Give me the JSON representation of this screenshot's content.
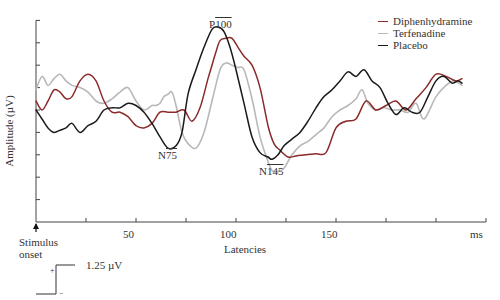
{
  "chart_data": {
    "type": "line",
    "title": "",
    "xlabel": "Latencies",
    "x_unit_label": "ms",
    "ylabel": "Amplitude (µV)",
    "xlim": [
      0,
      225
    ],
    "x_ticks": [
      0,
      25,
      50,
      75,
      100,
      125,
      150,
      175,
      200,
      225
    ],
    "x_tick_labels": {
      "50": "50",
      "100": "100",
      "150": "150",
      "225": "ms"
    },
    "y_ticks_count": 9,
    "ylim": [
      0,
      9
    ],
    "y_unit_note": "each y tick ~ 1 division; scale bar = 1.25 µV",
    "grid": false,
    "legend_position": "top-right",
    "stimulus_marker": {
      "x": 0,
      "label_line1": "Stimulus",
      "label_line2": "onset"
    },
    "annotations": [
      {
        "text": "P100",
        "x": 95,
        "y": 8.9
      },
      {
        "text": "N75",
        "x": 63,
        "y": 2.9
      },
      {
        "text": "N145",
        "x": 117,
        "y": 2.1
      }
    ],
    "scale_bar": {
      "label": "1.25 µV",
      "plus": "+",
      "minus": "−"
    },
    "series": [
      {
        "name": "Diphenhydramine",
        "color": "#8b2a2a",
        "x": [
          0,
          3,
          6,
          9,
          12,
          15,
          18,
          22,
          26,
          30,
          34,
          38,
          42,
          46,
          50,
          54,
          58,
          62,
          66,
          70,
          74,
          78,
          82,
          86,
          88,
          90,
          92,
          95,
          98,
          101,
          104,
          108,
          112,
          116,
          119,
          122,
          126,
          130,
          135,
          140,
          145,
          150,
          155,
          160,
          165,
          170,
          175,
          180,
          185,
          190,
          195,
          200,
          205,
          210,
          213
        ],
        "y": [
          5.4,
          5.0,
          5.4,
          5.9,
          5.8,
          5.5,
          5.6,
          6.3,
          6.6,
          6.3,
          5.4,
          4.9,
          4.9,
          4.7,
          4.3,
          4.2,
          4.4,
          4.9,
          4.9,
          4.9,
          5.0,
          4.5,
          5.1,
          6.4,
          7.0,
          7.6,
          8.1,
          8.2,
          8.2,
          7.8,
          7.4,
          7.0,
          6.0,
          4.3,
          3.5,
          3.2,
          2.9,
          2.95,
          3.0,
          3.05,
          3.1,
          4.2,
          4.5,
          4.6,
          5.4,
          5.0,
          5.2,
          5.4,
          5.0,
          5.5,
          6.0,
          6.6,
          6.5,
          6.3,
          6.4
        ]
      },
      {
        "name": "Terfenadine",
        "color": "#b8b8b8",
        "x": [
          0,
          3,
          6,
          9,
          12,
          15,
          18,
          22,
          26,
          30,
          34,
          38,
          42,
          46,
          50,
          54,
          58,
          60,
          62,
          64,
          66,
          68,
          70,
          73,
          76,
          80,
          84,
          88,
          92,
          95,
          98,
          101,
          104,
          108,
          112,
          116,
          118,
          121,
          124,
          128,
          132,
          136,
          140,
          144,
          148,
          152,
          156,
          160,
          163,
          166,
          170,
          174,
          178,
          182,
          186,
          190,
          194,
          200,
          205,
          209,
          213
        ],
        "y": [
          5.9,
          6.5,
          6.1,
          6.4,
          6.6,
          6.3,
          6.1,
          6.0,
          5.8,
          5.4,
          5.3,
          5.5,
          5.8,
          6.0,
          5.4,
          5.0,
          5.2,
          5.2,
          5.3,
          5.6,
          5.7,
          5.8,
          5.2,
          4.0,
          3.5,
          3.3,
          4.0,
          5.4,
          6.8,
          7.1,
          7.0,
          6.9,
          6.8,
          5.5,
          3.8,
          2.7,
          2.3,
          2.25,
          2.4,
          3.0,
          3.4,
          3.6,
          3.9,
          4.2,
          4.7,
          5.0,
          5.2,
          5.5,
          5.9,
          5.3,
          5.0,
          5.1,
          5.0,
          5.0,
          4.9,
          5.3,
          4.6,
          5.6,
          6.1,
          6.3,
          6.1
        ]
      },
      {
        "name": "Placebo",
        "color": "#1a1a1a",
        "x": [
          0,
          3,
          6,
          9,
          12,
          15,
          18,
          22,
          26,
          30,
          34,
          38,
          42,
          46,
          50,
          54,
          58,
          62,
          66,
          70,
          73,
          76,
          80,
          84,
          88,
          91,
          94,
          97,
          100,
          104,
          108,
          112,
          116,
          118,
          121,
          124,
          128,
          132,
          136,
          140,
          144,
          148,
          152,
          156,
          160,
          164,
          168,
          172,
          176,
          180,
          184,
          188,
          192,
          196,
          200,
          204,
          208,
          211,
          213
        ],
        "y": [
          5.0,
          4.6,
          4.2,
          4.0,
          4.1,
          4.2,
          4.4,
          4.0,
          4.3,
          4.5,
          5.0,
          5.1,
          5.1,
          5.3,
          5.2,
          4.9,
          4.4,
          3.8,
          3.3,
          3.4,
          4.0,
          5.7,
          6.8,
          7.8,
          8.6,
          8.7,
          8.5,
          7.8,
          6.8,
          5.3,
          3.8,
          3.1,
          2.9,
          2.8,
          3.0,
          3.4,
          3.7,
          4.0,
          4.5,
          5.1,
          5.6,
          5.9,
          6.3,
          6.7,
          6.5,
          6.8,
          6.3,
          6.0,
          5.3,
          4.8,
          5.1,
          4.9,
          4.9,
          5.6,
          6.3,
          6.5,
          6.2,
          6.3,
          6.2
        ]
      }
    ]
  },
  "labels": {
    "ylabel": "Amplitude (µV)",
    "xlabel": "Latencies",
    "unit": "ms",
    "tick50": "50",
    "tick100": "100",
    "tick150": "150",
    "stim1": "Stimulus",
    "stim2": "onset",
    "p100_prefix": "P",
    "p100_num": "100",
    "n75_prefix": "N",
    "n75_num": "75",
    "n145_prefix": "N",
    "n145_num": "145",
    "scale_label": "1.25 µV",
    "plus": "+",
    "minus": "−"
  },
  "legend": [
    {
      "label": "Diphenhydramine",
      "color": "#8b2a2a"
    },
    {
      "label": "Terfenadine",
      "color": "#b8b8b8"
    },
    {
      "label": "Placebo",
      "color": "#1a1a1a"
    }
  ]
}
